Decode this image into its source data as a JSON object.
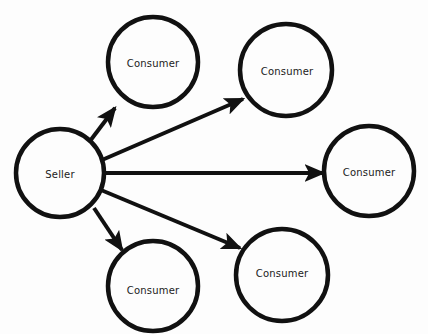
{
  "diagram": {
    "type": "node-link-diagram",
    "background_color": "#fdfdfd",
    "stroke_color": "#111111",
    "text_color": "#1b1b1b",
    "nodes": [
      {
        "id": "seller",
        "label": "Seller",
        "role": "source",
        "shape": "circle",
        "cx": 60,
        "cy": 173,
        "r": 44,
        "stroke_width": 4.5
      },
      {
        "id": "consumer-top-left",
        "label": "Consumer",
        "role": "target",
        "shape": "circle",
        "cx": 153,
        "cy": 62,
        "r": 45,
        "stroke_width": 4.5
      },
      {
        "id": "consumer-top-right",
        "label": "Consumer",
        "role": "target",
        "shape": "circle",
        "cx": 286,
        "cy": 70,
        "r": 46,
        "stroke_width": 4.5
      },
      {
        "id": "consumer-right",
        "label": "Consumer",
        "role": "target",
        "shape": "circle",
        "cx": 369,
        "cy": 171,
        "r": 45,
        "stroke_width": 4.5
      },
      {
        "id": "consumer-bottom-left",
        "label": "Consumer",
        "role": "target",
        "shape": "circle",
        "cx": 153,
        "cy": 286,
        "r": 45,
        "stroke_width": 4.5
      },
      {
        "id": "consumer-bottom-middle",
        "label": "Consumer",
        "role": "target",
        "shape": "circle",
        "cx": 282,
        "cy": 275,
        "r": 46,
        "stroke_width": 4.5
      }
    ],
    "edges": [
      {
        "id": "edge-seller-to-top-left",
        "from": "seller",
        "to": "consumer-top-left",
        "directed": true,
        "x1": 90,
        "y1": 141,
        "x2": 115,
        "y2": 108,
        "stroke_width": 4
      },
      {
        "id": "edge-seller-to-top-right",
        "from": "seller",
        "to": "consumer-top-right",
        "directed": true,
        "x1": 102,
        "y1": 160,
        "x2": 243,
        "y2": 99,
        "stroke_width": 4
      },
      {
        "id": "edge-seller-to-right",
        "from": "seller",
        "to": "consumer-right",
        "directed": true,
        "x1": 104,
        "y1": 173,
        "x2": 323,
        "y2": 173,
        "stroke_width": 4
      },
      {
        "id": "edge-seller-to-bottom-left",
        "from": "seller",
        "to": "consumer-bottom-left",
        "directed": true,
        "x1": 94,
        "y1": 208,
        "x2": 122,
        "y2": 250,
        "stroke_width": 4
      },
      {
        "id": "edge-seller-to-bottom-middle",
        "from": "seller",
        "to": "consumer-bottom-middle",
        "directed": true,
        "x1": 101,
        "y1": 190,
        "x2": 240,
        "y2": 248,
        "stroke_width": 4
      }
    ]
  }
}
